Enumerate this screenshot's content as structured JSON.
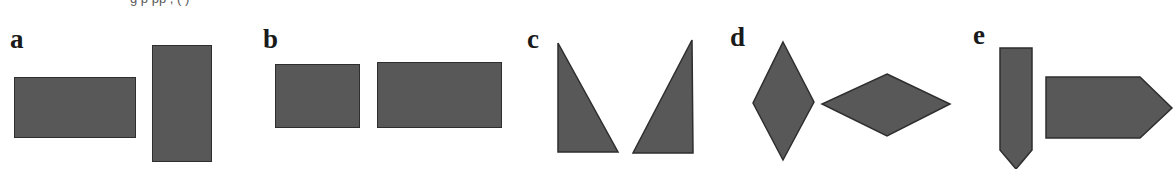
{
  "figure": {
    "width": 1176,
    "height": 169,
    "background_color": "#ffffff",
    "shape_fill_color": "#585858",
    "shape_stroke_color": "#2e2e2e",
    "label_color": "#1a1a1a",
    "cropped_top_text": "g p pp ,  ( )"
  },
  "panels": [
    {
      "id": "a",
      "label": "a",
      "label_x": 10,
      "label_y": 26,
      "description": "pair of rectangles: one wide horizontal, one tall vertical",
      "shapes": [
        {
          "name": "horizontal-rectangle",
          "type": "rect",
          "x": 14,
          "y": 77,
          "width": 122,
          "height": 61
        },
        {
          "name": "vertical-rectangle",
          "type": "rect",
          "x": 152,
          "y": 45,
          "width": 60,
          "height": 117
        }
      ]
    },
    {
      "id": "b",
      "label": "b",
      "label_x": 263,
      "label_y": 26,
      "description": "pair of horizontal rectangles of different widths",
      "shapes": [
        {
          "name": "small-rectangle",
          "type": "rect",
          "x": 275,
          "y": 64,
          "width": 85,
          "height": 64
        },
        {
          "name": "large-rectangle",
          "type": "rect",
          "x": 377,
          "y": 62,
          "width": 125,
          "height": 66
        }
      ]
    },
    {
      "id": "c",
      "label": "c",
      "label_x": 527,
      "label_y": 26,
      "description": "pair of mirrored right triangles forming a V gap",
      "shapes": [
        {
          "name": "left-triangle",
          "type": "polygon",
          "points": "558,43 558,152 618,152"
        },
        {
          "name": "right-triangle",
          "type": "polygon",
          "points": "692,40 633,153 693,153"
        }
      ]
    },
    {
      "id": "d",
      "label": "d",
      "label_x": 730,
      "label_y": 24,
      "description": "pair of rhombi: one elongated vertically, one elongated horizontally",
      "shapes": [
        {
          "name": "vertical-rhombus",
          "type": "polygon",
          "points": "783,42 814,102 783,160 753,103"
        },
        {
          "name": "horizontal-rhombus",
          "type": "polygon",
          "points": "887,74 950,104 887,136 822,104"
        }
      ]
    },
    {
      "id": "e",
      "label": "e",
      "label_x": 973,
      "label_y": 22,
      "description": "pair of pentagon arrow shapes: one pointing down, one pointing right",
      "shapes": [
        {
          "name": "down-pointing-pentagon",
          "type": "polygon",
          "points": "1000,48 1032,48 1032,150 1016,169 1000,150"
        },
        {
          "name": "right-pointing-pentagon",
          "type": "polygon",
          "points": "1046,77 1140,77 1172,108 1140,138 1046,138"
        }
      ]
    }
  ]
}
